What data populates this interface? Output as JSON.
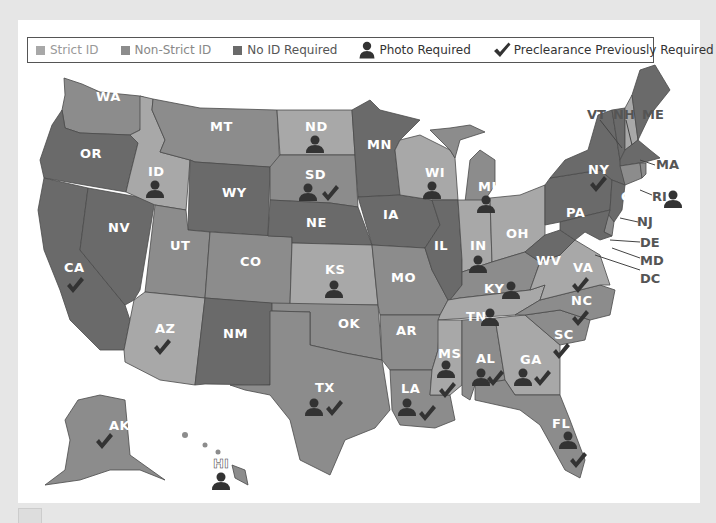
{
  "legend": {
    "items": [
      {
        "label": "Strict ID",
        "color": "#a8a8a8",
        "type": "swatch"
      },
      {
        "label": "Non-Strict ID",
        "color": "#8c8c8c",
        "type": "swatch"
      },
      {
        "label": "No ID Required",
        "color": "#6a6a6a",
        "type": "swatch"
      },
      {
        "label": "Photo Required",
        "icon": "person-icon",
        "type": "icon"
      },
      {
        "label": "Preclearance Previously Required",
        "icon": "checkmark-icon",
        "type": "icon"
      }
    ]
  },
  "colors": {
    "strict": "#a8a8a8",
    "nonstrict": "#8c8c8c",
    "noid": "#6a6a6a",
    "icon": "#333333",
    "background": "#e6e6e6",
    "panel": "#ffffff"
  },
  "states": [
    {
      "abbr": "WA",
      "category": "nonstrict",
      "photo": false,
      "preclearance": false
    },
    {
      "abbr": "OR",
      "category": "noid",
      "photo": false,
      "preclearance": false
    },
    {
      "abbr": "CA",
      "category": "noid",
      "photo": false,
      "preclearance": true
    },
    {
      "abbr": "NV",
      "category": "noid",
      "photo": false,
      "preclearance": false
    },
    {
      "abbr": "ID",
      "category": "strict",
      "photo": true,
      "preclearance": false
    },
    {
      "abbr": "MT",
      "category": "nonstrict",
      "photo": false,
      "preclearance": false
    },
    {
      "abbr": "WY",
      "category": "noid",
      "photo": false,
      "preclearance": false
    },
    {
      "abbr": "UT",
      "category": "nonstrict",
      "photo": false,
      "preclearance": false
    },
    {
      "abbr": "AZ",
      "category": "strict",
      "photo": false,
      "preclearance": true
    },
    {
      "abbr": "CO",
      "category": "nonstrict",
      "photo": false,
      "preclearance": false
    },
    {
      "abbr": "NM",
      "category": "noid",
      "photo": false,
      "preclearance": false
    },
    {
      "abbr": "ND",
      "category": "strict",
      "photo": true,
      "preclearance": false
    },
    {
      "abbr": "SD",
      "category": "nonstrict",
      "photo": true,
      "preclearance": true
    },
    {
      "abbr": "NE",
      "category": "noid",
      "photo": false,
      "preclearance": false
    },
    {
      "abbr": "KS",
      "category": "strict",
      "photo": true,
      "preclearance": false
    },
    {
      "abbr": "OK",
      "category": "nonstrict",
      "photo": false,
      "preclearance": false
    },
    {
      "abbr": "TX",
      "category": "nonstrict",
      "photo": true,
      "preclearance": true
    },
    {
      "abbr": "MN",
      "category": "noid",
      "photo": false,
      "preclearance": false
    },
    {
      "abbr": "IA",
      "category": "noid",
      "photo": false,
      "preclearance": false
    },
    {
      "abbr": "MO",
      "category": "nonstrict",
      "photo": false,
      "preclearance": false
    },
    {
      "abbr": "AR",
      "category": "nonstrict",
      "photo": false,
      "preclearance": false
    },
    {
      "abbr": "LA",
      "category": "nonstrict",
      "photo": true,
      "preclearance": true
    },
    {
      "abbr": "WI",
      "category": "strict",
      "photo": true,
      "preclearance": false
    },
    {
      "abbr": "IL",
      "category": "noid",
      "photo": false,
      "preclearance": false
    },
    {
      "abbr": "MI",
      "category": "nonstrict",
      "photo": true,
      "preclearance": false
    },
    {
      "abbr": "IN",
      "category": "strict",
      "photo": true,
      "preclearance": false
    },
    {
      "abbr": "OH",
      "category": "strict",
      "photo": false,
      "preclearance": false
    },
    {
      "abbr": "KY",
      "category": "nonstrict",
      "photo": true,
      "preclearance": false
    },
    {
      "abbr": "TN",
      "category": "strict",
      "photo": true,
      "preclearance": false
    },
    {
      "abbr": "MS",
      "category": "strict",
      "photo": true,
      "preclearance": true
    },
    {
      "abbr": "AL",
      "category": "nonstrict",
      "photo": true,
      "preclearance": true
    },
    {
      "abbr": "GA",
      "category": "strict",
      "photo": true,
      "preclearance": true
    },
    {
      "abbr": "FL",
      "category": "nonstrict",
      "photo": true,
      "preclearance": true
    },
    {
      "abbr": "SC",
      "category": "nonstrict",
      "photo": false,
      "preclearance": true
    },
    {
      "abbr": "NC",
      "category": "nonstrict",
      "photo": false,
      "preclearance": true
    },
    {
      "abbr": "VA",
      "category": "strict",
      "photo": false,
      "preclearance": true
    },
    {
      "abbr": "WV",
      "category": "noid",
      "photo": false,
      "preclearance": false
    },
    {
      "abbr": "PA",
      "category": "noid",
      "photo": false,
      "preclearance": false
    },
    {
      "abbr": "NY",
      "category": "noid",
      "photo": false,
      "preclearance": true
    },
    {
      "abbr": "VT",
      "category": "noid",
      "photo": false,
      "preclearance": false
    },
    {
      "abbr": "NH",
      "category": "strict",
      "photo": false,
      "preclearance": false
    },
    {
      "abbr": "ME",
      "category": "noid",
      "photo": false,
      "preclearance": false
    },
    {
      "abbr": "MA",
      "category": "noid",
      "photo": false,
      "preclearance": false
    },
    {
      "abbr": "RI",
      "category": "nonstrict",
      "photo": true,
      "preclearance": false
    },
    {
      "abbr": "CT",
      "category": "nonstrict",
      "photo": false,
      "preclearance": false
    },
    {
      "abbr": "NJ",
      "category": "noid",
      "photo": false,
      "preclearance": false
    },
    {
      "abbr": "DE",
      "category": "nonstrict",
      "photo": false,
      "preclearance": false
    },
    {
      "abbr": "MD",
      "category": "noid",
      "photo": false,
      "preclearance": false
    },
    {
      "abbr": "DC",
      "category": "noid",
      "photo": false,
      "preclearance": false
    },
    {
      "abbr": "AK",
      "category": "nonstrict",
      "photo": false,
      "preclearance": true
    },
    {
      "abbr": "HI",
      "category": "nonstrict",
      "photo": true,
      "preclearance": false
    }
  ]
}
